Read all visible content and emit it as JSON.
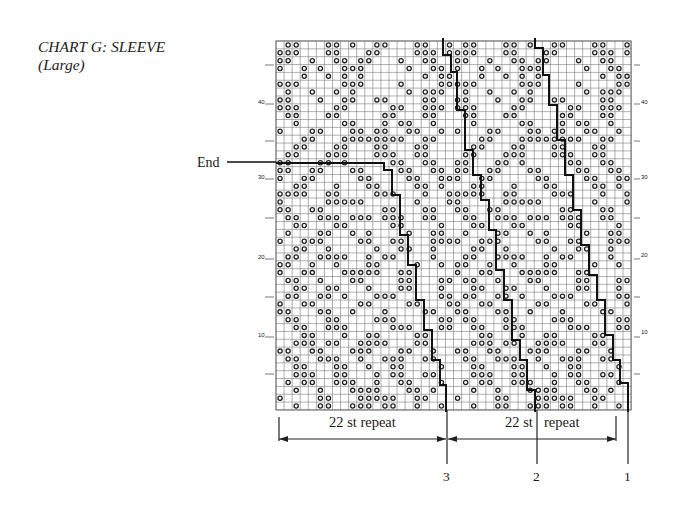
{
  "title": {
    "line1": "CHART G: SLEEVE",
    "line2": "(Large)"
  },
  "chart": {
    "columns": 44,
    "rows": 47,
    "cell_symbol": "o",
    "grid_origin": {
      "x": 276,
      "y": 41
    },
    "cell_w": 8.07,
    "cell_h": 7.85,
    "repeat_pattern_rows_top_to_bottom": [
      ".oo...oo.o..oo...oo..o",
      "ooo...oo...oo....ooo.o",
      "oo..o..oo.oo...o..oo..",
      "o..o.o..ooo.....o..oo.",
      "...o..o.o.o.......o.oo",
      "ooo.....ooo....o....oo",
      ".o..o..o.o......o.ooo.",
      "oo...o..oo..oo....oo..",
      "ooo....oo.....oo..ooo.",
      ".oo...oo.....oo...oo..",
      "..o.....oo...o.oo..o..",
      "o...oo...oo.oo..oo..o.",
      "...oo...oooooooo..oo..",
      "..oo...oo...oo...oo...",
      ".oo...ooo...ooo..oo...",
      "oo...oo.o.....oo..oo..",
      "oo..oo...oo....oo..oo.",
      "o..oo.....oo....oo..oo",
      "..oo...o...oo....oo.o.",
      "oooo..oo....ooo...o..o",
      "o.....ooooo......o...o",
      "oo..oo.......oo...oo..",
      ".oo..ooo.ooo.ooo..oo..",
      "..oo...oo.....oo....o.",
      ".o...oo..o.o....o..oo.",
      "o..ooo....oo..oo...ooo",
      "..oo..o.....o..oo..o..",
      ".oo..oooo..o.oo....o..",
      "oo..o..o...oo....o..o.",
      "o..oo...ooooo..oo.....",
      ".oo..o...oo....oo...oo",
      "..oo..oo...o...oo...o.",
      ".oo..oo.o...ooo.....oo",
      "o..oo.....oo....oo...o",
      "oo...oo..o...o....oo..",
      ".oo...oo....ooo.....oo",
      "..oo..ooo.....ooo...oo",
      "...oo...o..oo....oo...",
      "..ooo.oo..oooo...oo...",
      "oo..oo...ooo...oo..o..",
      ".oo..ooo..o..ooo..oo..",
      "..oo...oo..o..oo....o.",
      "..ooo..oo...o.oo..oo..",
      ".o.oo..ooo..o..oo...o.",
      "..o..o...oooo...oo.o..",
      "o....oo...ooooo..oo...",
      "..o..oo..ooo.oo..o..o."
    ],
    "row_numbers": [
      "10",
      "20",
      "30",
      "40"
    ],
    "end_label": "End",
    "repeat_labels": [
      "22 st repeat",
      "22 st",
      "repeat"
    ],
    "size_markers": [
      "3",
      "2",
      "1"
    ]
  },
  "colors": {
    "grid_line": "#7a7a7a",
    "heavy_line": "#111111",
    "symbol": "#222222",
    "text": "#1a1a1a"
  }
}
